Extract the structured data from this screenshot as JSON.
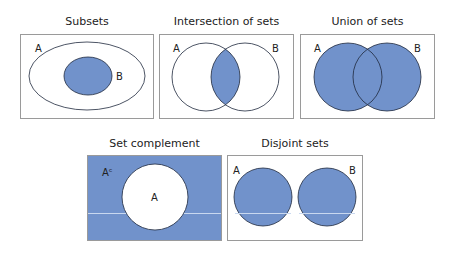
{
  "colors": {
    "fill": "#7192cb",
    "stroke": "#1f2a3d",
    "box_border": "#9a9a9a",
    "background": "#ffffff",
    "highlight_line": "#c9d8ef"
  },
  "panels": [
    {
      "id": "subsets",
      "title": "Subsets",
      "labels": [
        "A",
        "B"
      ]
    },
    {
      "id": "intersection",
      "title": "Intersection of sets",
      "labels": [
        "A",
        "B"
      ]
    },
    {
      "id": "union",
      "title": "Union of sets",
      "labels": [
        "A",
        "B"
      ]
    },
    {
      "id": "complement",
      "title": "Set complement",
      "labels": [
        "Aᶜ",
        "A"
      ]
    },
    {
      "id": "disjoint",
      "title": "Disjoint sets",
      "labels": [
        "A",
        "B"
      ]
    }
  ]
}
